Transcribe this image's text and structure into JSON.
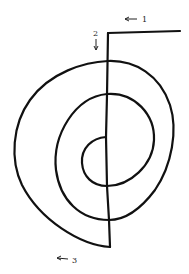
{
  "diagram": {
    "type": "spiral-path",
    "labels": [
      {
        "id": "1",
        "text": "1",
        "arrow": "left"
      },
      {
        "id": "2",
        "text": "2",
        "arrow": "down"
      },
      {
        "id": "3",
        "text": "3",
        "arrow": "left"
      }
    ],
    "stroke_color": "#111111",
    "background": "#ffffff"
  }
}
